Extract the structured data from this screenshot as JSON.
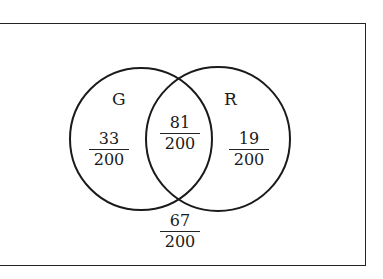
{
  "diagram": {
    "type": "venn",
    "sets": [
      {
        "id": "G",
        "label": "G"
      },
      {
        "id": "R",
        "label": "R"
      }
    ],
    "regions": {
      "G_only": {
        "numerator": "33",
        "denominator": "200"
      },
      "G_and_R": {
        "numerator": "81",
        "denominator": "200"
      },
      "R_only": {
        "numerator": "19",
        "denominator": "200"
      },
      "neither": {
        "numerator": "67",
        "denominator": "200"
      }
    }
  }
}
